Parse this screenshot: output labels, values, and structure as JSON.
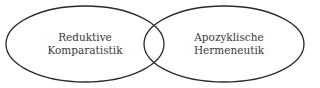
{
  "diagram": {
    "type": "venn",
    "sets": [
      {
        "label_line1": "Reduktive",
        "label_line2": "Komparatistik"
      },
      {
        "label_line1": "Apozyklische",
        "label_line2": "Hermeneutik"
      }
    ],
    "stroke_color": "#2a2a2a",
    "text_color": "#3a3a3a"
  }
}
